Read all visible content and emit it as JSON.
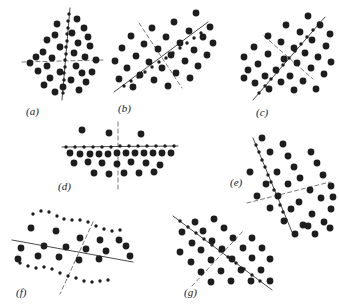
{
  "figure": {
    "caption_style": "italic-parenthesized-letters",
    "background_color": "#ffffff",
    "dot_color": "#1d1d1d",
    "line_color": "#4a4a4a",
    "dashed_line_color": "#6a6a6a",
    "width": 339,
    "height": 307,
    "panel_count": 7
  },
  "panels": [
    {
      "id": "a",
      "label": "(a)",
      "label_x": 26,
      "label_y": 115,
      "description": "vertical principal axis with horizontal dashed minor axis",
      "solid_line": {
        "x1": 70,
        "y1": 8,
        "x2": 62,
        "y2": 100
      },
      "dashed_line": {
        "x1": 22,
        "y1": 62,
        "x2": 103,
        "y2": 60
      },
      "axis_dots": [
        [
          69,
          14
        ],
        [
          68,
          21
        ],
        [
          68,
          28
        ],
        [
          67,
          34
        ],
        [
          67,
          41
        ],
        [
          66,
          47
        ],
        [
          66,
          54
        ],
        [
          65,
          60
        ],
        [
          65,
          67
        ],
        [
          64,
          73
        ],
        [
          64,
          80
        ],
        [
          63,
          86
        ],
        [
          63,
          93
        ]
      ],
      "data_dots": [
        [
          77,
          19
        ],
        [
          57,
          24
        ],
        [
          84,
          28
        ],
        [
          72,
          33
        ],
        [
          55,
          35
        ],
        [
          88,
          37
        ],
        [
          47,
          40
        ],
        [
          78,
          43
        ],
        [
          60,
          47
        ],
        [
          90,
          46
        ],
        [
          43,
          52
        ],
        [
          74,
          53
        ],
        [
          36,
          57
        ],
        [
          52,
          58
        ],
        [
          85,
          57
        ],
        [
          96,
          60
        ],
        [
          30,
          63
        ],
        [
          47,
          66
        ],
        [
          76,
          66
        ],
        [
          38,
          71
        ],
        [
          60,
          72
        ],
        [
          82,
          73
        ],
        [
          92,
          72
        ],
        [
          50,
          78
        ],
        [
          71,
          80
        ],
        [
          86,
          82
        ],
        [
          44,
          85
        ],
        [
          63,
          87
        ],
        [
          79,
          90
        ],
        [
          55,
          92
        ]
      ]
    },
    {
      "id": "b",
      "label": "(b)",
      "label_x": 118,
      "label_y": 112,
      "description": "diagonal up-right principal axis with dashed perpendicular minor axis",
      "solid_line": {
        "x1": 114,
        "y1": 92,
        "x2": 208,
        "y2": 22
      },
      "dashed_line": {
        "x1": 139,
        "y1": 23,
        "x2": 182,
        "y2": 88
      },
      "axis_dots": [
        [
          124,
          86
        ],
        [
          131,
          81
        ],
        [
          138,
          77
        ],
        [
          145,
          72
        ],
        [
          152,
          67
        ],
        [
          159,
          62
        ],
        [
          166,
          58
        ],
        [
          173,
          53
        ],
        [
          180,
          48
        ],
        [
          187,
          43
        ],
        [
          194,
          38
        ],
        [
          201,
          33
        ]
      ],
      "data_dots": [
        [
          196,
          13
        ],
        [
          174,
          22
        ],
        [
          210,
          27
        ],
        [
          152,
          28
        ],
        [
          189,
          31
        ],
        [
          131,
          36
        ],
        [
          166,
          37
        ],
        [
          203,
          37
        ],
        [
          144,
          44
        ],
        [
          180,
          43
        ],
        [
          213,
          43
        ],
        [
          122,
          48
        ],
        [
          158,
          49
        ],
        [
          194,
          50
        ],
        [
          136,
          56
        ],
        [
          171,
          55
        ],
        [
          207,
          55
        ],
        [
          115,
          61
        ],
        [
          149,
          62
        ],
        [
          185,
          61
        ],
        [
          127,
          68
        ],
        [
          162,
          68
        ],
        [
          198,
          66
        ],
        [
          140,
          75
        ],
        [
          176,
          73
        ],
        [
          119,
          79
        ],
        [
          154,
          80
        ],
        [
          190,
          78
        ],
        [
          133,
          87
        ],
        [
          168,
          86
        ]
      ]
    },
    {
      "id": "c",
      "label": "(c)",
      "label_x": 256,
      "label_y": 116,
      "description": "diagonal up-right principal axis with dashed perpendicular minor axis",
      "solid_line": {
        "x1": 253,
        "y1": 100,
        "x2": 325,
        "y2": 17
      },
      "dashed_line": {
        "x1": 264,
        "y1": 36,
        "x2": 313,
        "y2": 79
      },
      "axis_dots": [
        [
          259,
          93
        ],
        [
          265,
          86
        ],
        [
          271,
          79
        ],
        [
          277,
          72
        ],
        [
          283,
          65
        ],
        [
          289,
          58
        ],
        [
          295,
          51
        ],
        [
          301,
          44
        ],
        [
          307,
          37
        ],
        [
          313,
          30
        ],
        [
          319,
          23
        ]
      ],
      "data_dots": [
        [
          308,
          16
        ],
        [
          286,
          25
        ],
        [
          320,
          25
        ],
        [
          268,
          36
        ],
        [
          300,
          32
        ],
        [
          330,
          34
        ],
        [
          281,
          42
        ],
        [
          312,
          40
        ],
        [
          254,
          47
        ],
        [
          294,
          48
        ],
        [
          326,
          46
        ],
        [
          268,
          54
        ],
        [
          305,
          53
        ],
        [
          244,
          57
        ],
        [
          284,
          59
        ],
        [
          318,
          57
        ],
        [
          258,
          64
        ],
        [
          297,
          63
        ],
        [
          331,
          62
        ],
        [
          248,
          70
        ],
        [
          276,
          70
        ],
        [
          311,
          68
        ],
        [
          265,
          76
        ],
        [
          290,
          76
        ],
        [
          324,
          74
        ],
        [
          255,
          83
        ],
        [
          281,
          82
        ],
        [
          303,
          81
        ],
        [
          269,
          89
        ],
        [
          294,
          90
        ],
        [
          244,
          78
        ],
        [
          316,
          89
        ]
      ]
    },
    {
      "id": "d",
      "label": "(d)",
      "label_x": 58,
      "label_y": 190,
      "description": "horizontal principal axis with vertical dashed minor axis",
      "solid_line": {
        "x1": 62,
        "y1": 147,
        "x2": 178,
        "y2": 146
      },
      "dashed_line": {
        "x1": 118,
        "y1": 122,
        "x2": 118,
        "y2": 190
      },
      "axis_dots": [
        [
          66,
          147
        ],
        [
          75,
          147
        ],
        [
          84,
          147
        ],
        [
          93,
          147
        ],
        [
          102,
          147
        ],
        [
          111,
          147
        ],
        [
          120,
          146
        ],
        [
          129,
          146
        ],
        [
          138,
          146
        ],
        [
          147,
          146
        ],
        [
          156,
          146
        ],
        [
          165,
          146
        ],
        [
          174,
          146
        ]
      ],
      "data_dots": [
        [
          82,
          130
        ],
        [
          109,
          133
        ],
        [
          141,
          134
        ],
        [
          70,
          153
        ],
        [
          80,
          154
        ],
        [
          90,
          154
        ],
        [
          99,
          154
        ],
        [
          108,
          154
        ],
        [
          117,
          153
        ],
        [
          126,
          153
        ],
        [
          135,
          153
        ],
        [
          144,
          153
        ],
        [
          153,
          153
        ],
        [
          162,
          153
        ],
        [
          171,
          153
        ],
        [
          74,
          163
        ],
        [
          88,
          162
        ],
        [
          102,
          163
        ],
        [
          117,
          164
        ],
        [
          131,
          162
        ],
        [
          146,
          163
        ],
        [
          160,
          165
        ],
        [
          94,
          173
        ],
        [
          109,
          174
        ],
        [
          124,
          173
        ],
        [
          139,
          173
        ],
        [
          154,
          172
        ]
      ]
    },
    {
      "id": "e",
      "label": "(e)",
      "label_x": 230,
      "label_y": 186,
      "description": "steep diagonal principal axis with dashed minor axis",
      "solid_line": {
        "x1": 253,
        "y1": 138,
        "x2": 292,
        "y2": 232
      },
      "dashed_line": {
        "x1": 247,
        "y1": 203,
        "x2": 330,
        "y2": 182
      },
      "axis_dots": [
        [
          256,
          145
        ],
        [
          259,
          152
        ],
        [
          262,
          160
        ],
        [
          265,
          167
        ],
        [
          268,
          175
        ],
        [
          271,
          182
        ],
        [
          274,
          190
        ],
        [
          277,
          197
        ],
        [
          280,
          205
        ],
        [
          283,
          212
        ],
        [
          286,
          220
        ]
      ],
      "data_dots": [
        [
          283,
          144
        ],
        [
          262,
          138
        ],
        [
          288,
          156
        ],
        [
          311,
          152
        ],
        [
          250,
          172
        ],
        [
          294,
          167
        ],
        [
          317,
          163
        ],
        [
          277,
          172
        ],
        [
          300,
          178
        ],
        [
          323,
          175
        ],
        [
          266,
          184
        ],
        [
          288,
          184
        ],
        [
          310,
          190
        ],
        [
          331,
          186
        ],
        [
          257,
          196
        ],
        [
          278,
          196
        ],
        [
          299,
          202
        ],
        [
          321,
          198
        ],
        [
          270,
          208
        ],
        [
          291,
          209
        ],
        [
          312,
          214
        ],
        [
          331,
          209
        ],
        [
          284,
          221
        ],
        [
          303,
          225
        ],
        [
          324,
          222
        ],
        [
          295,
          234
        ],
        [
          315,
          234
        ],
        [
          270,
          152
        ],
        [
          333,
          197
        ]
      ]
    },
    {
      "id": "f",
      "label": "(f)",
      "label_x": 16,
      "label_y": 296,
      "description": "shallow solid axis with steep dashed axis, wavy dot rows",
      "solid_line": {
        "x1": 12,
        "y1": 240,
        "x2": 133,
        "y2": 262
      },
      "dashed_line": {
        "x1": 93,
        "y1": 222,
        "x2": 60,
        "y2": 294
      },
      "axis_dots": [
        [
          33,
          214
        ],
        [
          41,
          211
        ],
        [
          49,
          212
        ],
        [
          57,
          216
        ],
        [
          64,
          219
        ],
        [
          72,
          220
        ],
        [
          80,
          220
        ],
        [
          88,
          222
        ],
        [
          96,
          226
        ],
        [
          104,
          229
        ],
        [
          112,
          231
        ],
        [
          120,
          230
        ],
        [
          20,
          263
        ],
        [
          28,
          266
        ],
        [
          36,
          268
        ],
        [
          44,
          267
        ],
        [
          52,
          269
        ],
        [
          60,
          273
        ],
        [
          68,
          276
        ],
        [
          76,
          278
        ],
        [
          84,
          281
        ],
        [
          92,
          282
        ],
        [
          100,
          281
        ],
        [
          108,
          280
        ]
      ],
      "data_dots": [
        [
          31,
          228
        ],
        [
          56,
          231
        ],
        [
          80,
          238
        ],
        [
          100,
          240
        ],
        [
          119,
          240
        ],
        [
          21,
          248
        ],
        [
          44,
          246
        ],
        [
          66,
          247
        ],
        [
          86,
          249
        ],
        [
          106,
          251
        ],
        [
          18,
          259
        ],
        [
          38,
          256
        ],
        [
          59,
          257
        ],
        [
          79,
          260
        ],
        [
          99,
          259
        ],
        [
          126,
          246
        ],
        [
          130,
          256
        ]
      ]
    },
    {
      "id": "g",
      "label": "(g)",
      "label_x": 184,
      "label_y": 296,
      "description": "down-right solid axis with up-right dashed axis",
      "solid_line": {
        "x1": 173,
        "y1": 216,
        "x2": 272,
        "y2": 290
      },
      "dashed_line": {
        "x1": 192,
        "y1": 286,
        "x2": 244,
        "y2": 230
      },
      "axis_dots": [
        [
          180,
          221
        ],
        [
          188,
          227
        ],
        [
          196,
          233
        ],
        [
          204,
          239
        ],
        [
          212,
          245
        ],
        [
          220,
          251
        ],
        [
          228,
          257
        ],
        [
          236,
          263
        ],
        [
          244,
          269
        ],
        [
          252,
          275
        ],
        [
          260,
          281
        ]
      ],
      "data_dots": [
        [
          195,
          222
        ],
        [
          214,
          219
        ],
        [
          182,
          232
        ],
        [
          203,
          231
        ],
        [
          224,
          228
        ],
        [
          192,
          243
        ],
        [
          212,
          241
        ],
        [
          233,
          238
        ],
        [
          252,
          238
        ],
        [
          180,
          252
        ],
        [
          201,
          250
        ],
        [
          222,
          249
        ],
        [
          243,
          248
        ],
        [
          262,
          248
        ],
        [
          191,
          262
        ],
        [
          211,
          260
        ],
        [
          232,
          259
        ],
        [
          252,
          258
        ],
        [
          270,
          259
        ],
        [
          201,
          272
        ],
        [
          221,
          271
        ],
        [
          241,
          270
        ],
        [
          261,
          270
        ],
        [
          211,
          282
        ],
        [
          231,
          281
        ],
        [
          251,
          281
        ],
        [
          270,
          281
        ],
        [
          308,
          226
        ],
        [
          330,
          228
        ]
      ]
    }
  ]
}
